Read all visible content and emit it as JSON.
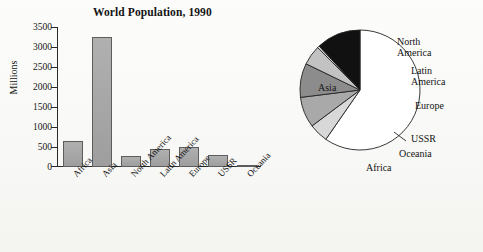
{
  "figure": {
    "bar_title": "World Population, 1990",
    "pie_title": "World Population, 1990"
  },
  "chart_data": [
    {
      "type": "bar",
      "title": "World Population, 1990",
      "xlabel": "",
      "ylabel": "Millions",
      "ylim": [
        0,
        3500
      ],
      "yticks": [
        "0",
        "500",
        "1000",
        "1500",
        "2000",
        "2500",
        "3000",
        "3500"
      ],
      "grid": false,
      "categories": [
        "Africa",
        "Asia",
        "North America",
        "Latin America",
        "Europe",
        "USSR",
        "Oceania"
      ],
      "values": [
        650,
        3250,
        280,
        450,
        500,
        290,
        30
      ],
      "bar_fill": "#a8a8a8",
      "bar_stroke": "#5d5d5d"
    },
    {
      "type": "pie",
      "title": "World Population, 1990",
      "legend_position": "outside-right",
      "labels": [
        "Asia",
        "North America",
        "Latin America",
        "Europe",
        "USSR",
        "Oceania",
        "Africa"
      ],
      "values": [
        3250,
        280,
        450,
        500,
        290,
        30,
        650
      ],
      "percent": [
        59.8,
        5.2,
        8.3,
        9.2,
        5.3,
        0.6,
        11.6
      ],
      "colors": [
        "#ffffff",
        "#d8d8d8",
        "#a9a9a9",
        "#8c8c8c",
        "#c2c2c2",
        "#e2e2e2",
        "#111111"
      ]
    }
  ],
  "bar_axis": {
    "y_title": "Millions",
    "ticks": [
      "3500",
      "3000",
      "2500",
      "2000",
      "1500",
      "1000",
      "500",
      "0"
    ]
  },
  "pie_labels": {
    "asia": "Asia",
    "north_america_l1": "North",
    "north_america_l2": "America",
    "latin_america_l1": "Latin",
    "latin_america_l2": "America",
    "europe": "Europe",
    "ussr": "USSR",
    "oceania": "Oceania",
    "africa": "Africa"
  },
  "bar_categories": {
    "c0": "Africa",
    "c1": "Asia",
    "c2": "North America",
    "c3": "Latin America",
    "c4": "Europe",
    "c5": "USSR",
    "c6": "Oceania"
  }
}
